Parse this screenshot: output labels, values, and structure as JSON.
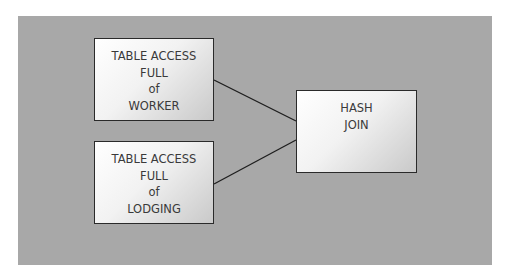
{
  "diagram": {
    "type": "execution-plan",
    "background_color": "#a8a8a8",
    "nodes": [
      {
        "id": "worker",
        "lines": [
          "TABLE ACCESS",
          "FULL",
          "of",
          "WORKER"
        ]
      },
      {
        "id": "lodging",
        "lines": [
          "TABLE ACCESS",
          "FULL",
          "of",
          "LODGING"
        ]
      },
      {
        "id": "hash",
        "lines": [
          "HASH",
          "JOIN"
        ]
      }
    ],
    "edges": [
      {
        "from": "worker",
        "to": "hash"
      },
      {
        "from": "lodging",
        "to": "hash"
      }
    ]
  }
}
